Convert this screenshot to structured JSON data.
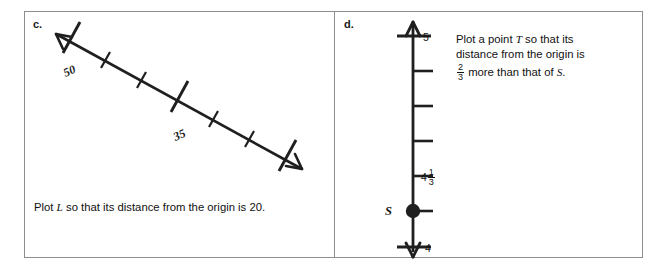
{
  "worksheet": {
    "panels": [
      {
        "id": "c",
        "part_label": "c.",
        "numberline": {
          "orientation": "diagonal-descending",
          "arrows": [
            "left-up",
            "right-down"
          ],
          "major_tick_labels": [
            "50",
            "35"
          ],
          "label_left": "50",
          "label_right": "35",
          "major_tick_count": 3,
          "minor_ticks_between": 2
        },
        "caption": {
          "before": "Plot ",
          "variable": "L",
          "after": " so that its distance from the origin is 20."
        }
      },
      {
        "id": "d",
        "part_label": "d.",
        "numberline": {
          "orientation": "vertical",
          "arrows": [
            "up",
            "down"
          ],
          "top_label": "5",
          "bottom_label": "4",
          "mixed_label_whole": "4",
          "mixed_label_numerator": "1",
          "mixed_label_denominator": "3",
          "point_label": "S",
          "minor_tick_count": 5
        },
        "caption": {
          "line1_before": "Plot a point ",
          "line1_variable": "T",
          "line1_after": " so that its",
          "line2": "distance from the origin is",
          "frac_numerator": "2",
          "frac_denominator": "3",
          "line3_mid": " more than that of ",
          "line3_variable": "S",
          "line3_end": "."
        }
      }
    ]
  },
  "colors": {
    "ink": "#1a1a1a",
    "border": "#8d8d8d",
    "background": "#ffffff"
  }
}
